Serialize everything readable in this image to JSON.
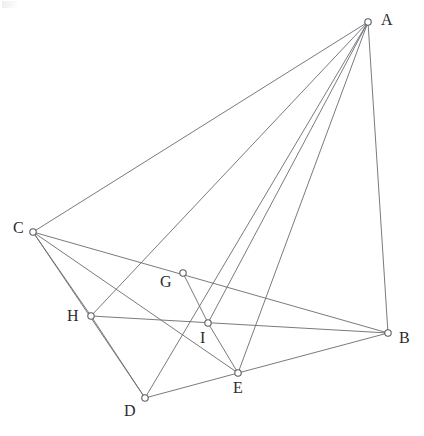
{
  "figure": {
    "canvas": {
      "width": 424,
      "height": 436,
      "background": "#ffffff"
    },
    "style": {
      "edge_color": "#6b6b70",
      "edge_width": 0.9,
      "vertex_fill": "#ffffff",
      "vertex_stroke": "#5d5d63",
      "vertex_radius": 3.2,
      "label_color": "#2b2b2e",
      "label_font_size": 16
    },
    "vertices": [
      {
        "id": "A",
        "label": "A",
        "x": 368,
        "y": 22,
        "label_x": 381,
        "label_y": 12
      },
      {
        "id": "B",
        "label": "B",
        "x": 388,
        "y": 333,
        "label_x": 399,
        "label_y": 330
      },
      {
        "id": "C",
        "label": "C",
        "x": 33,
        "y": 232,
        "label_x": 13,
        "label_y": 220
      },
      {
        "id": "D",
        "label": "D",
        "x": 145,
        "y": 398,
        "label_x": 124,
        "label_y": 403
      },
      {
        "id": "E",
        "label": "E",
        "x": 238,
        "y": 373,
        "label_x": 233,
        "label_y": 380
      },
      {
        "id": "G",
        "label": "G",
        "x": 183,
        "y": 273,
        "label_x": 160,
        "label_y": 274
      },
      {
        "id": "H",
        "label": "H",
        "x": 91,
        "y": 316,
        "label_x": 67,
        "label_y": 308
      },
      {
        "id": "I",
        "label": "I",
        "x": 208,
        "y": 323,
        "label_x": 200,
        "label_y": 330
      }
    ],
    "edges": [
      {
        "from": "A",
        "to": "C",
        "name": "edge-a-c"
      },
      {
        "from": "A",
        "to": "B",
        "name": "edge-a-b"
      },
      {
        "from": "A",
        "to": "D",
        "name": "edge-a-d"
      },
      {
        "from": "A",
        "to": "H",
        "name": "edge-a-h"
      },
      {
        "from": "A",
        "to": "I",
        "name": "edge-a-i"
      },
      {
        "from": "A",
        "to": "E",
        "name": "edge-a-e"
      },
      {
        "from": "C",
        "to": "H",
        "name": "edge-c-h"
      },
      {
        "from": "C",
        "to": "D",
        "name": "edge-c-d"
      },
      {
        "from": "C",
        "to": "E",
        "name": "edge-c-e"
      },
      {
        "from": "C",
        "to": "B",
        "name": "edge-c-b"
      },
      {
        "from": "H",
        "to": "D",
        "name": "edge-h-d"
      },
      {
        "from": "H",
        "to": "B",
        "name": "edge-h-b"
      },
      {
        "from": "D",
        "to": "E",
        "name": "edge-d-e"
      },
      {
        "from": "E",
        "to": "B",
        "name": "edge-e-b"
      },
      {
        "from": "G",
        "to": "I",
        "name": "edge-g-i"
      },
      {
        "from": "I",
        "to": "E",
        "name": "edge-i-e"
      }
    ],
    "labels_order": [
      "A",
      "B",
      "C",
      "D",
      "E",
      "G",
      "H",
      "I"
    ]
  }
}
